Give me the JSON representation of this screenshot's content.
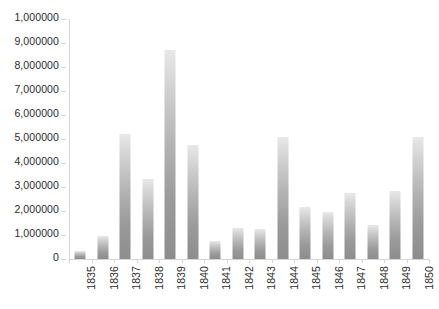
{
  "chart_data": {
    "type": "bar",
    "title": "",
    "subtitle": "",
    "xlabel": "",
    "ylabel": "",
    "legend": [],
    "legend_position": "none",
    "grid": false,
    "ylim": [
      0,
      10000000
    ],
    "y_tick_step": 1000000,
    "y_tick_labels": [
      "1,000000",
      "9,000000",
      "8,000000",
      "7,000000",
      "6,000000",
      "5,000000",
      "4,000000",
      "3,000000",
      "2,000000",
      "1,000000",
      "0"
    ],
    "y_tick_values": [
      10000000,
      9000000,
      8000000,
      7000000,
      6000000,
      5000000,
      4000000,
      3000000,
      2000000,
      1000000,
      0
    ],
    "categories": [
      "1835",
      "1836",
      "1837",
      "1838",
      "1839",
      "1840",
      "1841",
      "1842",
      "1843",
      "1844",
      "1845",
      "1846",
      "1847",
      "1848",
      "1849",
      "1850"
    ],
    "values": [
      350000,
      950000,
      5200000,
      3350000,
      8700000,
      4750000,
      750000,
      1300000,
      1250000,
      5100000,
      2150000,
      1950000,
      2750000,
      1400000,
      2850000,
      5100000
    ],
    "series": [
      {
        "name": "Series 1",
        "values": [
          350000,
          950000,
          5200000,
          3350000,
          8700000,
          4750000,
          750000,
          1300000,
          1250000,
          5100000,
          2150000,
          1950000,
          2750000,
          1400000,
          2850000,
          5100000
        ]
      }
    ],
    "colors": {
      "bar_top": "#e8e8e8",
      "bar_bottom": "#8d8d8d",
      "axis": "#d5d5d5",
      "text": "#2b2b2b",
      "background": "#ffffff"
    }
  }
}
